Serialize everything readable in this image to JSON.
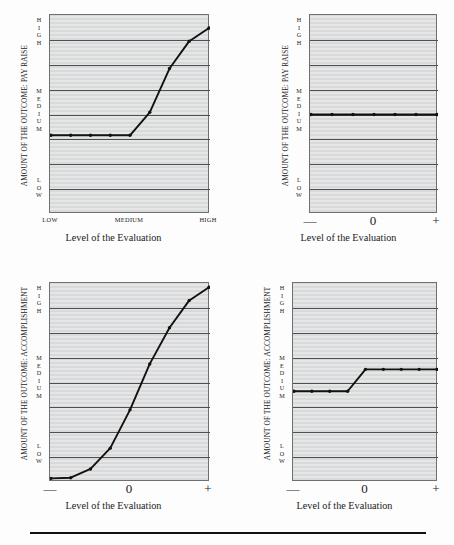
{
  "page": {
    "width": 454,
    "height": 545,
    "background_color": "#fdfdfd",
    "plot_fill_color": "#d8d9da",
    "gridline_color": "#4c4e50",
    "data_line_color": "#111111",
    "axis_frame_color": "#6e7072",
    "has_footer_rule": true
  },
  "charts": [
    {
      "id": "top-left",
      "chart_data": {
        "type": "line",
        "title": "",
        "ylabel": "AMOUNT OF THE OUTCOME: PAY RAISE",
        "xlabel": "Level of the Evaluation",
        "y_scale_labels": [
          "HIGH",
          "MEDIUM",
          "LOW"
        ],
        "y_scale_letters": [
          [
            "H",
            "I",
            "G",
            "H"
          ],
          [
            "M",
            "E",
            "D",
            "I",
            "U",
            "M"
          ],
          [
            "L",
            "O",
            "W"
          ]
        ],
        "x_tick_labels": [
          "LOW",
          "MEDIUM",
          "HIGH"
        ],
        "x_tick_count": 9,
        "gridline_count": 8,
        "grid": true,
        "legend": "none",
        "xlim": [
          0,
          8
        ],
        "ylim": [
          0,
          9
        ],
        "x": [
          0,
          1,
          2,
          3,
          4,
          5,
          6,
          7,
          8
        ],
        "values": [
          3.55,
          3.55,
          3.55,
          3.55,
          3.55,
          4.6,
          6.6,
          7.85,
          8.45
        ],
        "markers": true
      }
    },
    {
      "id": "top-right",
      "chart_data": {
        "type": "line",
        "title": "",
        "ylabel": "AMOUNT OF THE OUTCOME: PAY RAISE",
        "xlabel": "Level of the Evaluation",
        "y_scale_labels": [
          "HIGH",
          "MEDIUM",
          "LOW"
        ],
        "y_scale_letters": [
          [
            "H",
            "I",
            "G",
            "H"
          ],
          [
            "M",
            "E",
            "D",
            "I",
            "U",
            "M"
          ],
          [
            "L",
            "O",
            "W"
          ]
        ],
        "x_tick_labels": [
          "—",
          "0",
          "+"
        ],
        "x_tick_count": 7,
        "gridline_count": 8,
        "grid": true,
        "legend": "none",
        "xlim": [
          0,
          6
        ],
        "ylim": [
          0,
          9
        ],
        "x": [
          0,
          1,
          2,
          3,
          4,
          5,
          6
        ],
        "values": [
          4.5,
          4.5,
          4.5,
          4.5,
          4.5,
          4.5,
          4.5
        ],
        "markers": true
      }
    },
    {
      "id": "bottom-left",
      "chart_data": {
        "type": "line",
        "title": "",
        "ylabel": "AMOUNT OF THE OUTCOME: ACCOMPLISHMENT",
        "xlabel": "Level of the Evaluation",
        "y_scale_labels": [
          "HIGH",
          "MEDIUM",
          "LOW"
        ],
        "y_scale_letters": [
          [
            "H",
            "I",
            "G",
            "H"
          ],
          [
            "M",
            "E",
            "D",
            "I",
            "U",
            "M"
          ],
          [
            "L",
            "O",
            "W"
          ]
        ],
        "x_tick_labels": [
          "—",
          "0",
          "+"
        ],
        "x_tick_count": 9,
        "gridline_count": 8,
        "grid": true,
        "legend": "none",
        "xlim": [
          0,
          8
        ],
        "ylim": [
          0,
          9
        ],
        "x": [
          0,
          1,
          2,
          3,
          4,
          5,
          6,
          7,
          8
        ],
        "values": [
          0.12,
          0.15,
          0.55,
          1.5,
          3.25,
          5.35,
          7.0,
          8.25,
          8.85
        ],
        "markers": true
      }
    },
    {
      "id": "bottom-right",
      "chart_data": {
        "type": "line",
        "title": "",
        "ylabel": "AMOUNT OF THE OUTCOME: ACCOMPLISHMENT",
        "xlabel": "Level of the Evaluation",
        "y_scale_labels": [
          "HIGH",
          "MEDIUM",
          "LOW"
        ],
        "y_scale_letters": [
          [
            "H",
            "I",
            "G",
            "H"
          ],
          [
            "M",
            "E",
            "D",
            "I",
            "U",
            "M"
          ],
          [
            "L",
            "O",
            "W"
          ]
        ],
        "x_tick_labels": [
          "—",
          "0",
          "+"
        ],
        "x_tick_count": 9,
        "gridline_count": 8,
        "grid": true,
        "legend": "none",
        "xlim": [
          0,
          8
        ],
        "ylim": [
          0,
          9
        ],
        "x": [
          0,
          1,
          2,
          3,
          4,
          5,
          6,
          7,
          8
        ],
        "values": [
          4.1,
          4.1,
          4.1,
          4.1,
          5.1,
          5.1,
          5.1,
          5.1,
          5.1
        ],
        "markers": true
      }
    }
  ]
}
